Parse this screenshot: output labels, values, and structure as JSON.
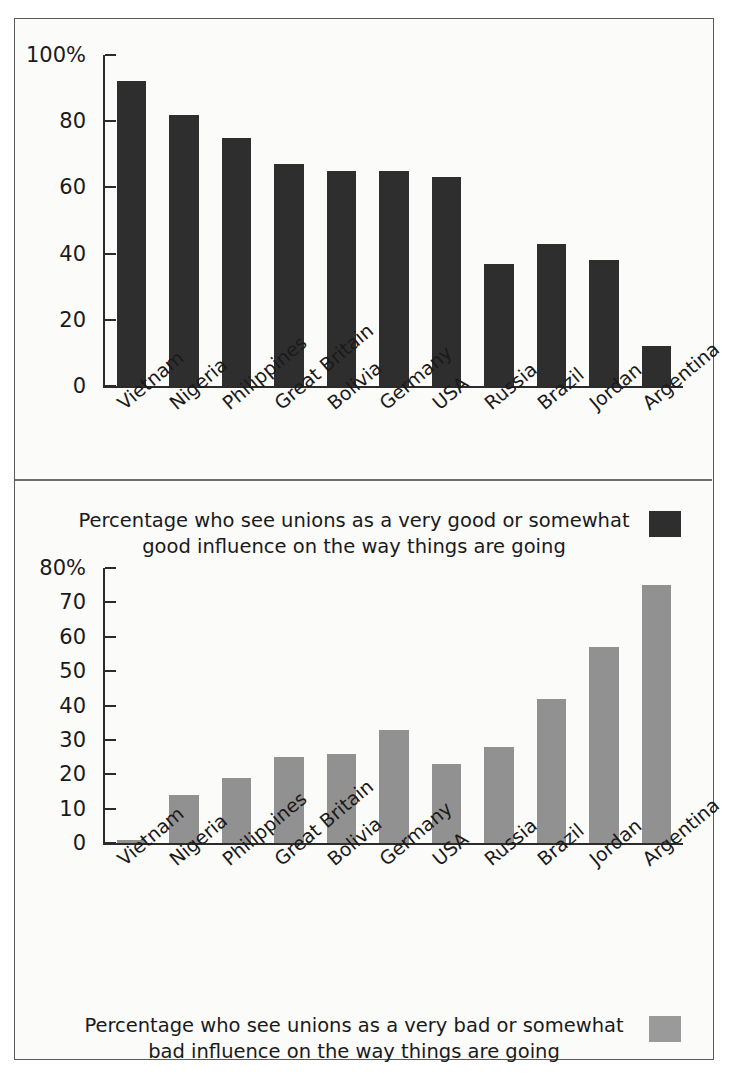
{
  "figure": {
    "background_color": "#fbfbfa",
    "border_color": "#5a5a5a"
  },
  "chart_data": [
    {
      "id": "good-influence",
      "type": "bar",
      "title": "Percentage who see unions as a very good or somewhat good influence on the way things are going",
      "caption_line1": "Percentage who see unions as a very good or somewhat",
      "caption_line2": "good influence on the way things are going",
      "xlabel": "",
      "ylabel": "",
      "ylim": [
        0,
        100
      ],
      "grid": false,
      "legend_position": "bottom-right",
      "bar_color": "#2e2e2e",
      "ytick_labels": [
        "0",
        "20",
        "40",
        "60",
        "80",
        "100%"
      ],
      "ytick_values": [
        0,
        20,
        40,
        60,
        80,
        100
      ],
      "categories": [
        "Vietnam",
        "Nigeria",
        "Philippines",
        "Great Britain",
        "Bolivia",
        "Germany",
        "USA",
        "Russia",
        "Brazil",
        "Jordan",
        "Argentina"
      ],
      "values": [
        92,
        82,
        75,
        67,
        65,
        65,
        63,
        37,
        43,
        38,
        12
      ]
    },
    {
      "id": "bad-influence",
      "type": "bar",
      "title": "Percentage who see unions as a very bad or somewhat bad influence on the way things are going",
      "caption_line1": "Percentage who see unions as a very bad or somewhat",
      "caption_line2": "bad influence on the way things are going",
      "xlabel": "",
      "ylabel": "",
      "ylim": [
        0,
        80
      ],
      "grid": false,
      "legend_position": "bottom-right",
      "bar_color": "#919191",
      "ytick_labels": [
        "0",
        "10",
        "20",
        "30",
        "40",
        "50",
        "60",
        "70",
        "80%"
      ],
      "ytick_values": [
        0,
        10,
        20,
        30,
        40,
        50,
        60,
        70,
        80
      ],
      "categories": [
        "Vietnam",
        "Nigeria",
        "Philippines",
        "Great Britain",
        "Bolivia",
        "Germany",
        "USA",
        "Russia",
        "Brazil",
        "Jordan",
        "Argentina"
      ],
      "values": [
        1,
        14,
        19,
        25,
        26,
        33,
        23,
        28,
        42,
        57,
        75
      ]
    }
  ]
}
